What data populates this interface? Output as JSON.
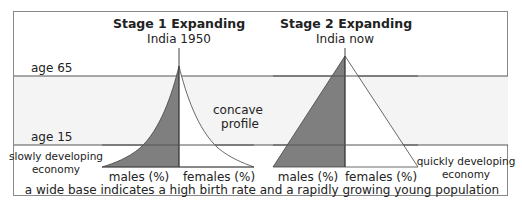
{
  "titles": {
    "stage1": "Stage 1 Expanding",
    "stage1_sub": "India 1950",
    "stage2": "Stage 2 Expanding",
    "stage2_sub": "India now"
  },
  "age_labels": {
    "age65": "age 65",
    "age15": "age 15"
  },
  "annotations": {
    "concave_line1": "concave",
    "concave_line2": "profile",
    "slow_line1": "slowly developing",
    "slow_line2": "economy",
    "quick_line1": "quickly developing",
    "quick_line2": "economy"
  },
  "axis_labels": {
    "p1_males": "males (%)",
    "p1_females": "females (%)",
    "p2_males": "males (%)",
    "p2_females": "females (%)"
  },
  "caption": "a wide base indicates a high birth rate and a rapidly growing young population",
  "colors": {
    "males_fill": "#7f7f7f",
    "females_fill": "#ffffff",
    "band_fill": "#f4f4f4",
    "line": "#444444"
  }
}
